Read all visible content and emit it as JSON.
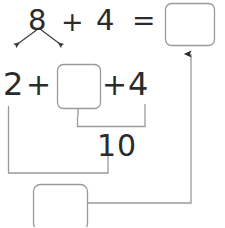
{
  "worksheet": {
    "title": "Make-a-ten addition strategy diagram",
    "stroke_color": "#9a9a9a",
    "text_color": "#2b2b2b",
    "background_color": "#ffffff"
  },
  "equation_top": {
    "addend_1": "8",
    "operator_plus": "+",
    "addend_2": "4",
    "operator_equals": "=",
    "answer_box_value": ""
  },
  "decomposition": {
    "left_part": "2",
    "right_part_box_value": "",
    "arrow_left_label": "",
    "arrow_right_label": ""
  },
  "equation_middle": {
    "term_1": "2",
    "operator_plus_1": "+",
    "term_2_box_value": "",
    "operator_plus_2": "+",
    "term_3": "4"
  },
  "subtotal": {
    "value": "10"
  },
  "final": {
    "answer_box_value": ""
  },
  "boxes": [
    {
      "name": "top-answer-box",
      "value": ""
    },
    {
      "name": "decomposition-box",
      "value": ""
    },
    {
      "name": "bottom-answer-box",
      "value": ""
    }
  ]
}
